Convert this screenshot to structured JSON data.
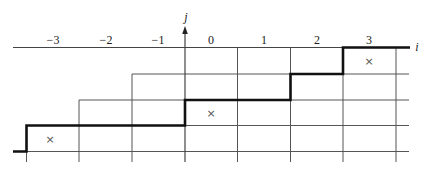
{
  "diagram": {
    "axes": {
      "horizontal_label": "i",
      "vertical_label": "j"
    },
    "column_labels": [
      "−3",
      "−2",
      "−1",
      "0",
      "1",
      "2",
      "3"
    ],
    "column_values": [
      -3,
      -2,
      -1,
      0,
      1,
      2,
      3
    ],
    "grid": {
      "vertical_x": [
        26.5,
        79,
        132,
        185,
        237.5,
        290.5,
        343,
        396
      ],
      "horizontal_y": [
        47.5,
        74,
        100,
        125.5,
        151.5
      ]
    },
    "marks": [
      {
        "symbol": "×",
        "column": -3,
        "row": "between lower rows"
      },
      {
        "symbol": "×",
        "column": 0,
        "row": "middle"
      },
      {
        "symbol": "×",
        "column": 3,
        "row": "top"
      }
    ],
    "staircase_path_description": "thick monotone lattice path rising left to right in steps"
  }
}
